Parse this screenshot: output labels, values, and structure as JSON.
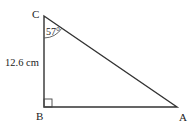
{
  "diagram": {
    "type": "right-triangle",
    "vertices": {
      "C": {
        "label": "C",
        "x": 44,
        "y": 16
      },
      "B": {
        "label": "B",
        "x": 44,
        "y": 107
      },
      "A": {
        "label": "A",
        "x": 177,
        "y": 107
      }
    },
    "side_label": "12.6 cm",
    "angle_label": "57°",
    "right_angle_at": "B",
    "colors": {
      "line": "#333333",
      "text": "#222222",
      "arc": "#555555"
    }
  }
}
